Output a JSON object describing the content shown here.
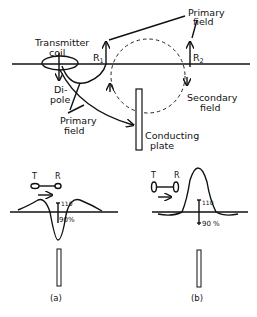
{
  "top_diagram": {
    "transmitter_label_line1": "Transmitter",
    "transmitter_label_line2": "coil",
    "dipole_line1": "Di-",
    "dipole_line2": "pole",
    "primary_field_bottom_line1": "Primary",
    "primary_field_bottom_line2": "field",
    "primary_field_top_line1": "Primary",
    "primary_field_top_line2": "field",
    "r1_main": "R",
    "r1_sub": "1",
    "r2_main": "R",
    "r2_sub": "2",
    "secondary_line1": "Secondary",
    "secondary_line2": "field",
    "plate_line1": "Conducting",
    "plate_line2": "plate"
  },
  "panel_a": {
    "t_label": "T",
    "r_label": "R",
    "tick_high": "110",
    "tick_low": "90",
    "percent": "%",
    "caption": "(a)"
  },
  "panel_b": {
    "t_label": "T",
    "r_label": "R",
    "tick_high": "110",
    "tick_low": "90",
    "percent": "%",
    "caption": "(b)"
  }
}
